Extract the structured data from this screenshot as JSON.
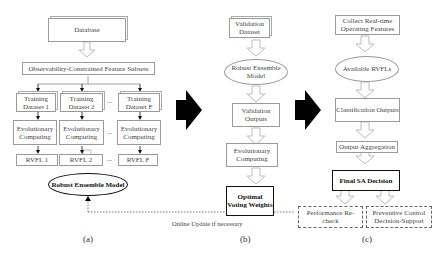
{
  "panel_a": {
    "database": "Database",
    "feature_subsets": "Observability-Constrained Feature Subsets",
    "training": [
      "Training Dataset 1",
      "Training Dataset 2",
      "Training Dataset F"
    ],
    "evolutionary": [
      "Evolutionary Computing",
      "Evolutionary Computing",
      "Evolutionary Computing"
    ],
    "rvfl": [
      "RVFL 1",
      "RVFL 2",
      "RVFL F"
    ],
    "ellipsis": "...",
    "robust_model": "Robust Ensemble Model",
    "caption": "(a)"
  },
  "panel_b": {
    "validation_dataset": "Validation Dataset",
    "robust_model": "Robust Ensemble Model",
    "validation_outputs": "Validation Outputs",
    "evolutionary": "Evolutionary Computing",
    "optimal_weights": "Optimal Voting Weights",
    "caption": "(b)"
  },
  "panel_c": {
    "collect": "Collect Real-time Operating Features",
    "available": "Available RVFLs",
    "classification": "Classification Outputs",
    "aggregation": "Output Aggregation",
    "final": "Final SA Decision",
    "performance": "Performance Re-check",
    "preventive": "Preventive Control Decision-Support",
    "caption": "(c)"
  },
  "feedback_label": "Online Update if necessary"
}
